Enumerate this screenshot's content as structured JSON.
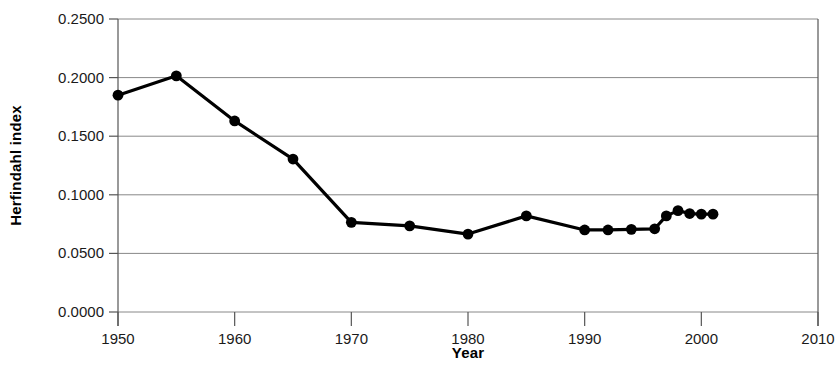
{
  "chart_data": {
    "type": "line",
    "title": "",
    "xlabel": "Year",
    "ylabel": "Herfindahl index",
    "xlim": [
      1950,
      2010
    ],
    "ylim": [
      0.0,
      0.25
    ],
    "grid": true,
    "legend": false,
    "x_ticks": [
      "1950",
      "1960",
      "1970",
      "1980",
      "1990",
      "2000",
      "2010"
    ],
    "x_tick_values": [
      1950,
      1960,
      1970,
      1980,
      1990,
      2000,
      2010
    ],
    "y_ticks": [
      "0.0000",
      "0.0500",
      "0.1000",
      "0.1500",
      "0.2000",
      "0.2500"
    ],
    "y_tick_values": [
      0.0,
      0.05,
      0.1,
      0.15,
      0.2,
      0.25
    ],
    "series": [
      {
        "name": "Herfindahl index",
        "marker": "circle",
        "x": [
          1950,
          1955,
          1960,
          1965,
          1970,
          1975,
          1980,
          1985,
          1990,
          1992,
          1994,
          1996,
          1997,
          1998,
          1999,
          2000,
          2001
        ],
        "values": [
          0.185,
          0.2015,
          0.163,
          0.1305,
          0.0765,
          0.0735,
          0.0665,
          0.082,
          0.07,
          0.07,
          0.0705,
          0.071,
          0.082,
          0.0865,
          0.084,
          0.0835,
          0.0835
        ]
      }
    ]
  }
}
